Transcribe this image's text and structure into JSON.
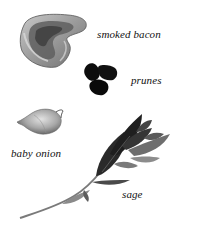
{
  "ingredients": [
    {
      "id": "smoked-bacon",
      "label": "smoked bacon"
    },
    {
      "id": "prunes",
      "label": "prunes"
    },
    {
      "id": "baby-onion",
      "label": "baby onion"
    },
    {
      "id": "sage",
      "label": "sage"
    }
  ],
  "colors": {
    "background": "#ffffff",
    "text": "#111111",
    "bacon_light": "#b5b5b5",
    "bacon_dark": "#5a5a5a",
    "prunes": "#0d0d0d",
    "onion": "#a9a9a9",
    "sage_dark": "#2a2a2a",
    "sage_light": "#8a8a8a"
  }
}
